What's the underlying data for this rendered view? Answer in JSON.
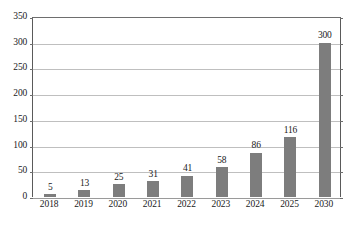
{
  "chart_data": {
    "type": "bar",
    "title": "",
    "subtitle": "",
    "xlabel": "",
    "ylabel": "",
    "categories": [
      "2018",
      "2019",
      "2020",
      "2021",
      "2022",
      "2023",
      "2024",
      "2025",
      "2030"
    ],
    "values": [
      5,
      13,
      25,
      31,
      41,
      58,
      86,
      116,
      300
    ],
    "value_labels": [
      "5",
      "13",
      "25",
      "31",
      "41",
      "58",
      "86",
      "116",
      "300"
    ],
    "ylim": [
      0,
      350
    ],
    "ytick_values": [
      0,
      50,
      100,
      150,
      200,
      250,
      300,
      350
    ],
    "ytick_labels": [
      "0",
      "50",
      "100",
      "150",
      "200",
      "250",
      "300",
      "350"
    ],
    "grid": true,
    "legend": false,
    "legend_position": "none",
    "bar_color": "#7d7d7d",
    "gridline_color": "#bfbfbf",
    "axis_color": "#5a5a5a",
    "background_color": "#ffffff",
    "text_color": "#1a1a1a"
  }
}
